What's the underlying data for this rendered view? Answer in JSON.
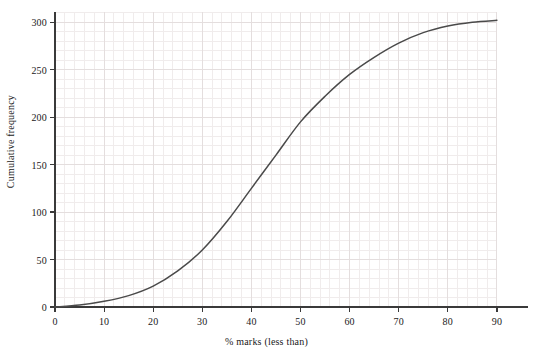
{
  "chart_data": {
    "type": "line",
    "title": "",
    "subtitle": "",
    "xlabel": "% marks (less than)",
    "ylabel": "Cumulative frequency",
    "xlim": [
      0,
      90
    ],
    "ylim": [
      0,
      310
    ],
    "xticks": [
      0,
      10,
      20,
      30,
      40,
      50,
      60,
      70,
      80,
      90
    ],
    "yticks": [
      0,
      50,
      100,
      150,
      200,
      250,
      300
    ],
    "xtick_labels": [
      "0",
      "10",
      "20",
      "30",
      "40",
      "50",
      "60",
      "70",
      "80",
      "90"
    ],
    "ytick_labels": [
      "0",
      "50",
      "100",
      "150",
      "200",
      "250",
      "300"
    ],
    "grid": true,
    "grid_style": "graph-paper minor and major gridlines",
    "grid_minor_step_x": 2,
    "grid_minor_step_y": 10,
    "grid_major_step_x": 10,
    "grid_major_step_y": 50,
    "legend": false,
    "legend_position": "none",
    "series": [
      {
        "name": "Cumulative frequency",
        "color": "#4a4a4a",
        "x": [
          0,
          5,
          10,
          15,
          20,
          25,
          30,
          35,
          40,
          45,
          50,
          55,
          60,
          65,
          70,
          75,
          80,
          85,
          90
        ],
        "values": [
          0,
          2,
          6,
          12,
          22,
          38,
          60,
          90,
          125,
          160,
          195,
          222,
          245,
          263,
          278,
          289,
          296,
          300,
          302
        ]
      }
    ],
    "annotations": [],
    "axis_color": "#3a3a3a",
    "background_color": "#ffffff",
    "grid_color_minor": "#f0ecec",
    "grid_color_major": "#e4dede"
  },
  "figure": {
    "x_axis_title": "% marks (less than)",
    "y_axis_title": "Cumulative frequency"
  }
}
